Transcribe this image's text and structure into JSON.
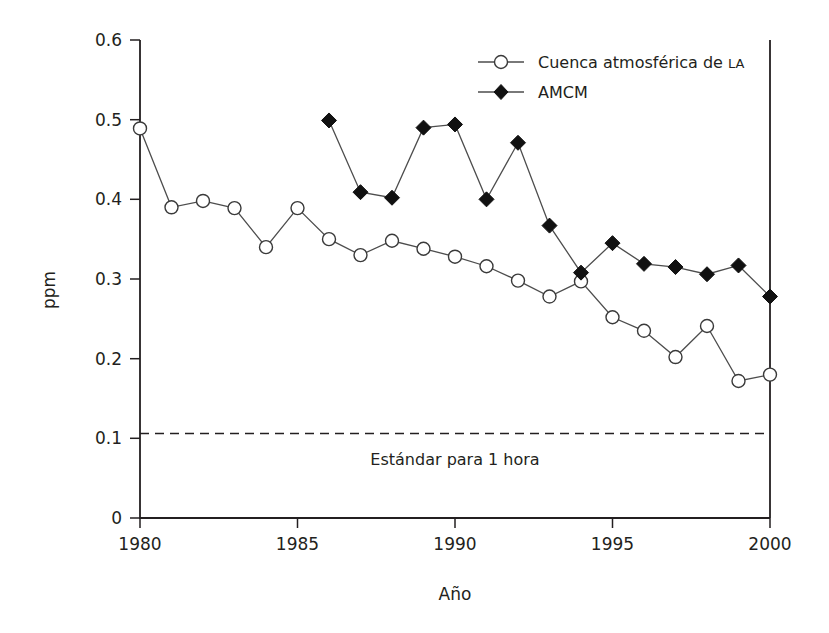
{
  "chart_data": {
    "type": "line",
    "title": "",
    "subtitle": "",
    "xlabel": "Año",
    "ylabel": "ppm",
    "xlim": [
      1980,
      2000
    ],
    "ylim": [
      0,
      0.6
    ],
    "grid": false,
    "legend_position": "top-right",
    "x": [
      1980,
      1981,
      1982,
      1983,
      1984,
      1985,
      1986,
      1987,
      1988,
      1989,
      1990,
      1991,
      1992,
      1993,
      1994,
      1995,
      1996,
      1997,
      1998,
      1999,
      2000
    ],
    "xticks": [
      "1980",
      "1985",
      "1990",
      "1995",
      "2000"
    ],
    "xtick_values": [
      1980,
      1985,
      1990,
      1995,
      2000
    ],
    "yticks": [
      "0",
      "0.1",
      "0.2",
      "0.3",
      "0.4",
      "0.5",
      "0.6"
    ],
    "ytick_values": [
      0,
      0.1,
      0.2,
      0.3,
      0.4,
      0.5,
      0.6
    ],
    "series": [
      {
        "name": "Cuenca atmosférica de LA",
        "name_main": "Cuenca atmosférica de ",
        "name_smallcaps": "LA",
        "marker": "open-circle",
        "color": "#ffffff",
        "stroke": "#3a3a3a",
        "x": [
          1980,
          1981,
          1982,
          1983,
          1984,
          1985,
          1986,
          1987,
          1988,
          1989,
          1990,
          1991,
          1992,
          1993,
          1994,
          1995,
          1996,
          1997,
          1998,
          1999,
          2000
        ],
        "values": [
          0.489,
          0.39,
          0.398,
          0.389,
          0.34,
          0.389,
          0.35,
          0.33,
          0.348,
          0.338,
          0.328,
          0.316,
          0.298,
          0.278,
          0.297,
          0.252,
          0.235,
          0.202,
          0.241,
          0.172,
          0.18
        ]
      },
      {
        "name": "AMCM",
        "name_main": "AMCM",
        "name_smallcaps": "",
        "marker": "filled-diamond",
        "color": "#111111",
        "stroke": "#111111",
        "x": [
          1986,
          1987,
          1988,
          1989,
          1990,
          1991,
          1992,
          1993,
          1994,
          1995,
          1996,
          1997,
          1998,
          1999,
          2000
        ],
        "values": [
          0.499,
          0.409,
          0.402,
          0.49,
          0.494,
          0.4,
          0.471,
          0.367,
          0.308,
          0.345,
          0.319,
          0.315,
          0.306,
          0.317,
          0.278
        ]
      }
    ],
    "annotations": [
      {
        "type": "hline",
        "label": "Estándar para 1 hora",
        "value": 0.106,
        "style": "dashed"
      }
    ]
  },
  "axes": {
    "y_label": "ppm",
    "x_label": "Año",
    "y_tick_0": "0",
    "y_tick_1": "0.1",
    "y_tick_2": "0.2",
    "y_tick_3": "0.3",
    "y_tick_4": "0.4",
    "y_tick_5": "0.5",
    "y_tick_6": "0.6",
    "x_tick_0": "1980",
    "x_tick_1": "1985",
    "x_tick_2": "1990",
    "x_tick_3": "1995",
    "x_tick_4": "2000"
  },
  "legend": {
    "item_1_main": "Cuenca atmosférica de ",
    "item_1_small": "LA",
    "item_2": "AMCM"
  },
  "annotation": {
    "standard_label": "Estándar para 1 hora"
  }
}
